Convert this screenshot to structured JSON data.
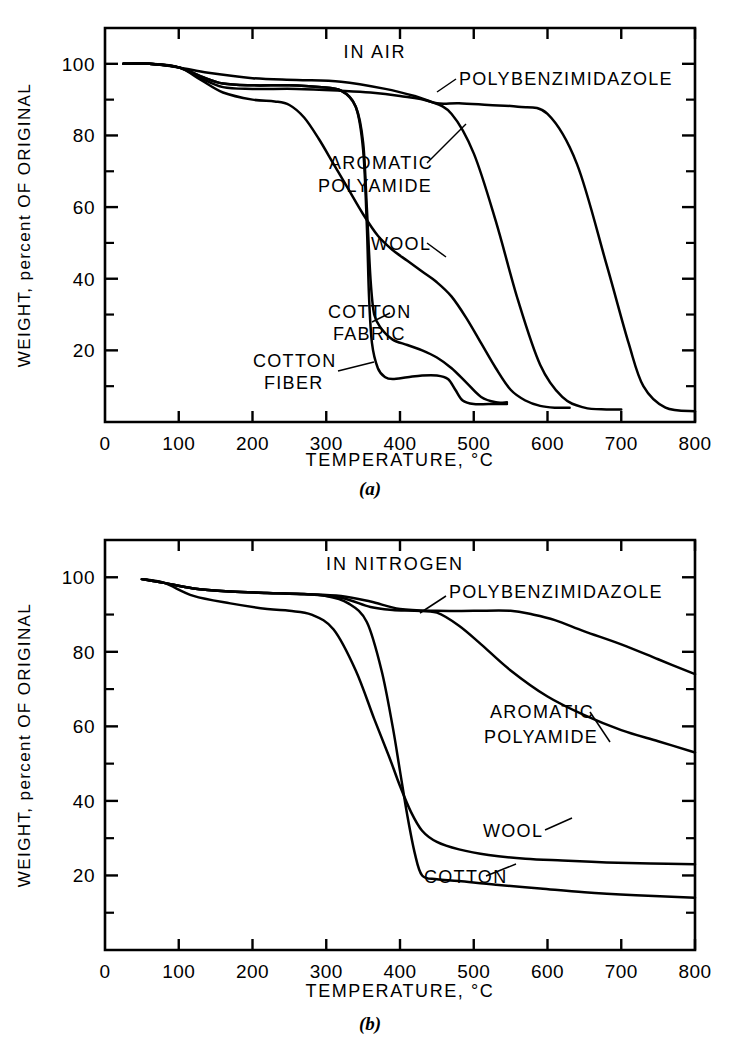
{
  "figure": {
    "panels": [
      {
        "panel_label": "(a)",
        "title": "IN AIR",
        "xlabel": "TEMPERATURE, °C",
        "ylabel": "WEIGHT, percent OF ORIGINAL",
        "xticks": [
          "0",
          "100",
          "200",
          "300",
          "400",
          "500",
          "600",
          "700",
          "800"
        ],
        "yticks": [
          "100",
          "80",
          "60",
          "40",
          "20"
        ],
        "series_labels": [
          {
            "text": "POLYBENZIMIDAZOLE"
          },
          {
            "text": "AROMATIC"
          },
          {
            "text": "POLYAMIDE"
          },
          {
            "text": "WOOL"
          },
          {
            "text": "COTTON"
          },
          {
            "text": "FABRIC"
          },
          {
            "text": "COTTON"
          },
          {
            "text": "FIBER"
          }
        ]
      },
      {
        "panel_label": "(b)",
        "title": "IN NITROGEN",
        "xlabel": "TEMPERATURE, °C",
        "ylabel": "WEIGHT, percent OF ORIGINAL",
        "xticks": [
          "0",
          "100",
          "200",
          "300",
          "400",
          "500",
          "600",
          "700",
          "800"
        ],
        "yticks": [
          "100",
          "80",
          "60",
          "40",
          "20"
        ],
        "series_labels": [
          {
            "text": "POLYBENZIMIDAZOLE"
          },
          {
            "text": "AROMATIC"
          },
          {
            "text": "POLYAMIDE"
          },
          {
            "text": "WOOL"
          },
          {
            "text": "COTTON"
          }
        ]
      }
    ]
  },
  "chart_data": [
    {
      "type": "line",
      "title": "IN AIR",
      "panel": "(a)",
      "xlabel": "TEMPERATURE, °C",
      "ylabel": "WEIGHT, percent OF ORIGINAL",
      "xlim": [
        0,
        800
      ],
      "ylim": [
        0,
        110
      ],
      "xticks": [
        0,
        100,
        200,
        300,
        400,
        500,
        600,
        700,
        800
      ],
      "yticks": [
        100,
        80,
        60,
        40,
        20
      ],
      "yminorticks": [
        110,
        90,
        70,
        50,
        30,
        10
      ],
      "grid": false,
      "legend": "inline-annotations",
      "series": [
        {
          "name": "POLYBENZIMIDAZOLE",
          "x": [
            25,
            60,
            100,
            140,
            200,
            260,
            320,
            380,
            420,
            450,
            480,
            520,
            560,
            600,
            640,
            680,
            710,
            730,
            760,
            800
          ],
          "y": [
            100,
            100,
            99,
            97.5,
            96,
            95.5,
            95,
            93,
            91,
            89,
            89,
            88.5,
            88,
            86,
            72,
            44,
            22,
            10,
            4,
            3
          ]
        },
        {
          "name": "AROMATIC POLYAMIDE",
          "x": [
            25,
            60,
            100,
            130,
            160,
            200,
            260,
            320,
            360,
            400,
            440,
            470,
            500,
            530,
            560,
            590,
            620,
            650,
            680,
            700
          ],
          "y": [
            100,
            100,
            99,
            96,
            93.5,
            93,
            93,
            92.5,
            92,
            91,
            89.5,
            86,
            75,
            56,
            34,
            16,
            7,
            4,
            3.5,
            3.5
          ]
        },
        {
          "name": "WOOL",
          "x": [
            25,
            60,
            100,
            130,
            160,
            200,
            230,
            250,
            270,
            290,
            310,
            330,
            350,
            370,
            390,
            410,
            430,
            450,
            470,
            490,
            510,
            530,
            550,
            570,
            590,
            610,
            630
          ],
          "y": [
            100,
            100,
            99,
            95.5,
            92,
            90,
            89.5,
            88.5,
            85,
            79,
            72,
            65,
            58,
            52,
            48,
            45,
            42,
            39,
            35,
            29,
            22,
            15,
            9,
            6,
            4.5,
            4,
            4
          ]
        },
        {
          "name": "COTTON FABRIC",
          "x": [
            25,
            60,
            100,
            130,
            160,
            200,
            250,
            290,
            320,
            340,
            350,
            355,
            360,
            365,
            375,
            390,
            410,
            430,
            450,
            470,
            490,
            510,
            530,
            545
          ],
          "y": [
            100,
            100,
            99,
            96.5,
            94.5,
            94,
            94,
            93.5,
            92.5,
            88,
            78,
            60,
            40,
            30,
            26,
            23,
            21.5,
            20,
            18,
            15,
            11,
            7,
            5.5,
            5.5
          ]
        },
        {
          "name": "COTTON FIBER",
          "x": [
            25,
            60,
            100,
            130,
            160,
            200,
            250,
            290,
            320,
            340,
            350,
            355,
            358,
            362,
            370,
            380,
            390,
            410,
            430,
            450,
            465,
            475,
            485,
            500,
            520,
            545
          ],
          "y": [
            100,
            100,
            99,
            96.5,
            94.5,
            94,
            94,
            93.5,
            92.5,
            88,
            76,
            55,
            35,
            22,
            15,
            12.5,
            12,
            12.5,
            13,
            13,
            12,
            9,
            6,
            5,
            5,
            5
          ]
        }
      ],
      "annotations": [
        {
          "text": "POLYBENZIMIDAZOLE",
          "x": 470,
          "y": 89
        },
        {
          "text": "AROMATIC POLYAMIDE",
          "x": 430,
          "y": 81
        },
        {
          "text": "WOOL",
          "x": 390,
          "y": 50
        },
        {
          "text": "COTTON FABRIC",
          "x": 390,
          "y": 27
        },
        {
          "text": "COTTON FIBER",
          "x": 330,
          "y": 13
        }
      ]
    },
    {
      "type": "line",
      "title": "IN NITROGEN",
      "panel": "(b)",
      "xlabel": "TEMPERATURE, °C",
      "ylabel": "WEIGHT, percent OF ORIGINAL",
      "xlim": [
        0,
        800
      ],
      "ylim": [
        0,
        110
      ],
      "xticks": [
        0,
        100,
        200,
        300,
        400,
        500,
        600,
        700,
        800
      ],
      "yticks": [
        100,
        80,
        60,
        40,
        20
      ],
      "yminorticks": [
        110,
        90,
        70,
        50,
        30,
        10
      ],
      "grid": false,
      "legend": "inline-annotations",
      "series": [
        {
          "name": "POLYBENZIMIDAZOLE",
          "x": [
            50,
            80,
            120,
            170,
            220,
            270,
            320,
            360,
            400,
            450,
            500,
            550,
            580,
            610,
            650,
            700,
            750,
            800
          ],
          "y": [
            99.5,
            98.5,
            97,
            96.2,
            95.8,
            95.5,
            95,
            93.5,
            91.5,
            91,
            91,
            91,
            90,
            88.5,
            85.5,
            82,
            78,
            74
          ]
        },
        {
          "name": "AROMATIC POLYAMIDE",
          "x": [
            50,
            80,
            120,
            170,
            220,
            270,
            320,
            360,
            390,
            420,
            450,
            480,
            510,
            550,
            600,
            650,
            700,
            750,
            800
          ],
          "y": [
            99.5,
            98.5,
            97,
            96.2,
            95.8,
            95.5,
            94.5,
            92,
            91.2,
            91,
            90.5,
            87,
            82,
            75,
            68,
            63,
            59,
            56,
            53
          ]
        },
        {
          "name": "WOOL",
          "x": [
            50,
            80,
            120,
            170,
            220,
            250,
            280,
            310,
            340,
            365,
            385,
            400,
            415,
            430,
            450,
            480,
            520,
            570,
            620,
            680,
            740,
            800
          ],
          "y": [
            99.5,
            98.5,
            95,
            93,
            91.5,
            91,
            90,
            86,
            75,
            62,
            52,
            44,
            37,
            32,
            29,
            27,
            25.5,
            24.5,
            24,
            23.5,
            23.2,
            23
          ]
        },
        {
          "name": "COTTON",
          "x": [
            50,
            80,
            120,
            170,
            220,
            260,
            300,
            330,
            355,
            375,
            390,
            400,
            410,
            420,
            430,
            450,
            480,
            530,
            590,
            650,
            720,
            800
          ],
          "y": [
            99.5,
            98.5,
            97,
            96.2,
            95.8,
            95.5,
            95,
            93,
            88,
            75,
            60,
            48,
            36,
            26,
            20,
            19,
            18.5,
            17.5,
            16.5,
            15.5,
            14.7,
            14
          ]
        }
      ],
      "annotations": [
        {
          "text": "POLYBENZIMIDAZOLE",
          "x": 470,
          "y": 96
        },
        {
          "text": "AROMATIC POLYAMIDE",
          "x": 490,
          "y": 57
        },
        {
          "text": "WOOL",
          "x": 530,
          "y": 20
        },
        {
          "text": "COTTON",
          "x": 455,
          "y": 10
        }
      ]
    }
  ]
}
